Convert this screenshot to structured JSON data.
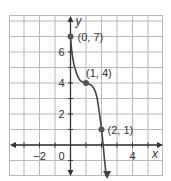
{
  "header": {
    "partial_text": ""
  },
  "chart_data": {
    "type": "line",
    "title": "",
    "xlabel": "x",
    "ylabel": "y",
    "xlim": [
      -4,
      6
    ],
    "ylim": [
      -2,
      8
    ],
    "grid": true,
    "x_ticks": [
      -2,
      0,
      4
    ],
    "y_ticks": [
      2,
      4,
      6
    ],
    "series": [
      {
        "name": "curve",
        "points": [
          [
            0,
            7
          ],
          [
            0.1,
            5.9
          ],
          [
            0.3,
            4.9
          ],
          [
            0.6,
            4.2
          ],
          [
            1,
            4
          ],
          [
            1.4,
            3.8
          ],
          [
            1.7,
            3.1
          ],
          [
            2,
            1
          ],
          [
            2.2,
            -1
          ],
          [
            2.3,
            -2
          ]
        ],
        "arrows": "both"
      }
    ],
    "annotations": [
      {
        "point": [
          0,
          7
        ],
        "label": "(0, 7)"
      },
      {
        "point": [
          1,
          4
        ],
        "label": "(1, 4)"
      },
      {
        "point": [
          2,
          1
        ],
        "label": "(2, 1)"
      }
    ],
    "colors": {
      "grid": "#b8b8b8",
      "axis": "#333333",
      "curve": "#444444",
      "point": "#555555"
    }
  }
}
